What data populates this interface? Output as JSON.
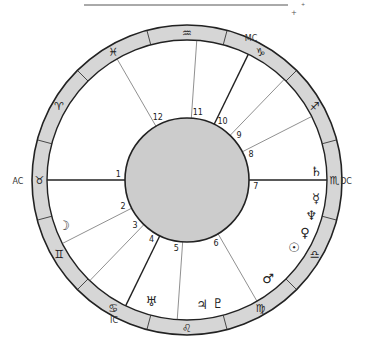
{
  "header": {
    "line": {
      "x1": 84,
      "y1": 5,
      "x2": 288,
      "y2": 5,
      "color": "#555555"
    },
    "marks": [
      {
        "glyph": "+",
        "x": 294,
        "y": 15,
        "size": 7
      },
      {
        "glyph": "+",
        "x": 303,
        "y": 6,
        "size": 5
      }
    ]
  },
  "colors": {
    "ring_fill": "#d6d6d6",
    "center_fill": "#cccccc",
    "stroke": "#222222",
    "house_line": "#444444",
    "background": "#ffffff"
  },
  "geometry": {
    "cx": 187,
    "cy": 180,
    "r_outer": 155,
    "r_ring_inner": 140,
    "r_center": 62
  },
  "zodiac": {
    "divider_offset_deg": 15,
    "signs": [
      {
        "name": "taurus",
        "glyph": "♉",
        "angle": 180
      },
      {
        "name": "aries",
        "glyph": "♈",
        "angle": 150
      },
      {
        "name": "pisces",
        "glyph": "♓",
        "angle": 120
      },
      {
        "name": "aquarius",
        "glyph": "♒",
        "angle": 90
      },
      {
        "name": "capricorn",
        "glyph": "♑",
        "angle": 60
      },
      {
        "name": "sagittarius",
        "glyph": "♐",
        "angle": 30
      },
      {
        "name": "scorpio",
        "glyph": "♏",
        "angle": 0
      },
      {
        "name": "libra",
        "glyph": "♎",
        "angle": 330
      },
      {
        "name": "virgo",
        "glyph": "♍",
        "angle": 300
      },
      {
        "name": "leo",
        "glyph": "♌",
        "angle": 270
      },
      {
        "name": "cancer",
        "glyph": "♋",
        "angle": 240
      },
      {
        "name": "gemini",
        "glyph": "♊",
        "angle": 210
      }
    ]
  },
  "houses": [
    {
      "num": "1",
      "angle": 180,
      "axis": true
    },
    {
      "num": "2",
      "angle": 207
    },
    {
      "num": "3",
      "angle": 226
    },
    {
      "num": "4",
      "angle": 244,
      "axis": true
    },
    {
      "num": "5",
      "angle": 266
    },
    {
      "num": "6",
      "angle": 300
    },
    {
      "num": "7",
      "angle": 0,
      "axis": true
    },
    {
      "num": "8",
      "angle": 27
    },
    {
      "num": "9",
      "angle": 46
    },
    {
      "num": "10",
      "angle": 64,
      "axis": true
    },
    {
      "num": "11",
      "angle": 86
    },
    {
      "num": "12",
      "angle": 120
    }
  ],
  "angles": [
    {
      "label": "AC",
      "x": 18,
      "y": 184
    },
    {
      "label": "DC",
      "x": 346,
      "y": 184
    },
    {
      "label": "MC",
      "x": 251,
      "y": 41
    },
    {
      "label": "IC",
      "x": 114,
      "y": 323
    }
  ],
  "planets": [
    {
      "name": "saturn",
      "glyph": "♄",
      "x": 316,
      "y": 176
    },
    {
      "name": "mercury",
      "glyph": "☿",
      "x": 316,
      "y": 203
    },
    {
      "name": "neptune",
      "glyph": "♆",
      "x": 311,
      "y": 220
    },
    {
      "name": "venus",
      "glyph": "♀",
      "x": 305,
      "y": 237
    },
    {
      "name": "sun",
      "glyph": "☉",
      "x": 294,
      "y": 252
    },
    {
      "name": "mars",
      "glyph": "♂",
      "x": 268,
      "y": 283
    },
    {
      "name": "pluto",
      "glyph": "♇",
      "x": 218,
      "y": 308
    },
    {
      "name": "jupiter",
      "glyph": "♃",
      "x": 202,
      "y": 309
    },
    {
      "name": "uranus",
      "glyph": "♅",
      "x": 151,
      "y": 306
    },
    {
      "name": "moon",
      "glyph": "☽",
      "x": 64,
      "y": 230
    }
  ]
}
